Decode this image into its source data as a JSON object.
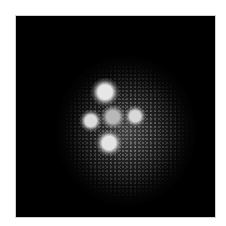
{
  "image": {
    "subject": "quadruply lensed point source (cross pattern)",
    "background_color": "#000000",
    "frame_color": "#cfcfcf"
  },
  "spots": [
    {
      "name": "top",
      "x": 89,
      "y": 76,
      "size": 16,
      "color": "#e6e6e6"
    },
    {
      "name": "left",
      "x": 75,
      "y": 105,
      "size": 13,
      "color": "#dcdcdc"
    },
    {
      "name": "center",
      "x": 97,
      "y": 101,
      "size": 14,
      "color": "#b8b8b8"
    },
    {
      "name": "right",
      "x": 119,
      "y": 100,
      "size": 12,
      "color": "#d8d8d8"
    },
    {
      "name": "bottom",
      "x": 93,
      "y": 127,
      "size": 15,
      "color": "#e4e4e4"
    }
  ]
}
